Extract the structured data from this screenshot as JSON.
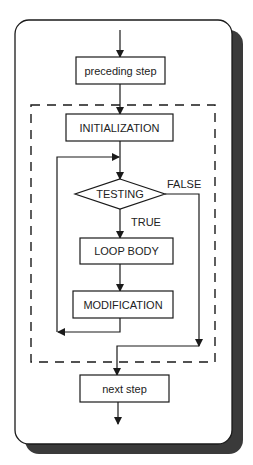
{
  "diagram": {
    "type": "flowchart",
    "title": "",
    "colors": {
      "line": "#1a1a1a",
      "panel_bg": "#ffffff",
      "shadow": "#3a3a3a",
      "text": "#222222"
    },
    "nodes": {
      "preceding": {
        "label": "preceding step",
        "shape": "rectangle"
      },
      "initialization": {
        "label": "INITIALIZATION",
        "shape": "rectangle"
      },
      "testing": {
        "label": "TESTING",
        "shape": "diamond"
      },
      "loop_body": {
        "label": "LOOP BODY",
        "shape": "rectangle"
      },
      "modification": {
        "label": "MODIFICATION",
        "shape": "rectangle"
      },
      "next": {
        "label": "next step",
        "shape": "rectangle"
      }
    },
    "edge_labels": {
      "true_label": "TRUE",
      "false_label": "FALSE"
    },
    "edges": [
      {
        "from": "start",
        "to": "preceding"
      },
      {
        "from": "preceding",
        "to": "initialization"
      },
      {
        "from": "initialization",
        "to": "testing"
      },
      {
        "from": "testing",
        "to": "loop_body",
        "label": "TRUE"
      },
      {
        "from": "loop_body",
        "to": "modification"
      },
      {
        "from": "modification",
        "to": "testing",
        "kind": "loop-back"
      },
      {
        "from": "testing",
        "to": "next",
        "label": "FALSE"
      },
      {
        "from": "next",
        "to": "end"
      }
    ],
    "grouping": {
      "style": "dashed",
      "contains": [
        "initialization",
        "testing",
        "loop_body",
        "modification"
      ]
    }
  }
}
